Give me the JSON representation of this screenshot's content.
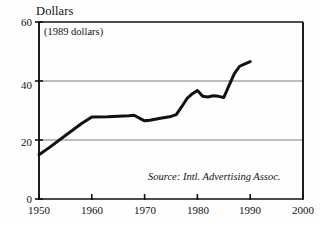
{
  "chart_data": {
    "type": "line",
    "title": "Dollars",
    "subtitle": "(1989 dollars)",
    "xlabel": "",
    "ylabel": "Dollars",
    "xlim": [
      1950,
      2000
    ],
    "ylim": [
      0,
      60
    ],
    "grid": true,
    "legend": null,
    "annotations": [
      {
        "name": "source",
        "text": "Source: Intl. Advertising Assoc."
      }
    ],
    "xticks": [
      "1950",
      "1960",
      "1970",
      "1980",
      "1990",
      "2000"
    ],
    "xtick_values": [
      1950,
      1960,
      1970,
      1980,
      1990,
      2000
    ],
    "yticks": [
      "0",
      "20",
      "40",
      "60"
    ],
    "ytick_values": [
      0,
      20,
      40,
      60
    ],
    "series": [
      {
        "name": "Advertising spending per capita",
        "color": "#111111",
        "x": [
          1950,
          1952,
          1955,
          1958,
          1960,
          1963,
          1967,
          1968,
          1970,
          1971,
          1973,
          1975,
          1976,
          1977,
          1978,
          1979,
          1980,
          1981,
          1982,
          1983,
          1984,
          1985,
          1986,
          1987,
          1988,
          1989,
          1990
        ],
        "values": [
          15.0,
          17.5,
          21.5,
          25.5,
          27.8,
          27.9,
          28.2,
          28.4,
          26.5,
          26.7,
          27.4,
          28.0,
          28.6,
          31.2,
          34.0,
          35.6,
          36.8,
          34.8,
          34.6,
          35.0,
          34.8,
          34.4,
          38.5,
          42.5,
          45.0,
          45.8,
          46.6
        ]
      }
    ]
  },
  "axis": {
    "y_title": "Dollars",
    "plot_subtitle": "(1989 dollars)",
    "source_text": "Source: Intl. Advertising Assoc.",
    "y_labels": [
      "60",
      "40",
      "20",
      "0"
    ],
    "x_labels": [
      "1950",
      "1960",
      "1970",
      "1980",
      "1990",
      "2000"
    ]
  },
  "colors": {
    "line": "#111111",
    "grid": "#7a7a7a",
    "axis": "#111111",
    "background": "#fefefe"
  }
}
